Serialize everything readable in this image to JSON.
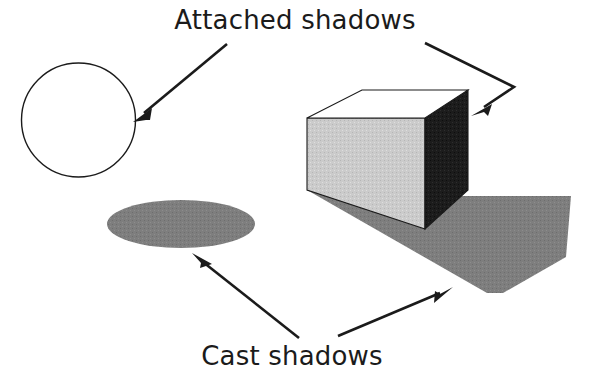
{
  "figure": {
    "background_color": "#ffffff",
    "width": 590,
    "height": 375
  },
  "labels": {
    "top": "Attached shadows",
    "bottom": "Cast shadows"
  },
  "colors": {
    "outline": "#1b1b1b",
    "text": "#1b1b1b",
    "background": "#ffffff",
    "sphere_lit": "#ffffff",
    "sphere_attached_shadow": "#808080",
    "cube_top_face": "#ffffff",
    "cube_front_face": "#c8c8c8",
    "cube_right_face": "#1c1c1c",
    "cast_shadow": "#7e7e7e",
    "arrow": "#1b1b1b"
  },
  "objects": {
    "sphere": {
      "name": "sphere",
      "shadow_type": "attached",
      "description": "Circle with crescent-shaped attached shadow on lower right"
    },
    "sphere_cast_shadow": {
      "name": "ellipse-cast-shadow",
      "shadow_type": "cast",
      "description": "Flat gray ellipse on ground below sphere"
    },
    "cube": {
      "name": "cube",
      "shadow_type": "attached",
      "description": "Cube with white top face, light gray front face and dark attached shadow on right face"
    },
    "cube_cast_shadow": {
      "name": "polygon-cast-shadow",
      "shadow_type": "cast",
      "description": "Gray polygon cast on ground to the lower right of the cube"
    }
  },
  "annotations": [
    {
      "id": "arrow-to-sphere",
      "from_label": "top",
      "points_to": "sphere",
      "style": "straight"
    },
    {
      "id": "arrow-to-cube",
      "from_label": "top",
      "points_to": "cube",
      "style": "bent"
    },
    {
      "id": "arrow-to-ellipse",
      "from_label": "bottom",
      "points_to": "sphere_cast_shadow",
      "style": "straight"
    },
    {
      "id": "arrow-to-cube-shadow",
      "from_label": "bottom",
      "points_to": "cube_cast_shadow",
      "style": "straight"
    }
  ]
}
